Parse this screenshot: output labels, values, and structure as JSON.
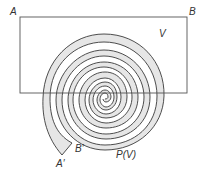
{
  "diagram": {
    "type": "spiral-mapping",
    "labels": {
      "A": "A",
      "B": "B",
      "V": "V",
      "A_prime": "A′",
      "B_prime": "B′",
      "PV": "P(V)"
    },
    "colors": {
      "stroke": "#3a3a3a",
      "rect_stroke": "#555555",
      "band_fill": "#e6e6e6",
      "background": "#ffffff"
    },
    "rectangle": {
      "x": 20,
      "y": 17,
      "width": 167,
      "height": 76
    },
    "spiral_center": {
      "x": 105,
      "y": 96
    }
  }
}
